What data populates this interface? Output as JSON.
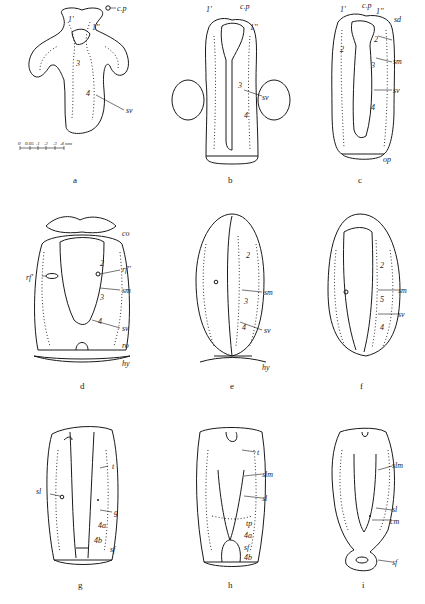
{
  "figure": {
    "panels": [
      {
        "id": "a",
        "caption": "a",
        "labels": [
          "c.p",
          "1'",
          "1''",
          "3",
          "4",
          "sv"
        ],
        "scale_bar": {
          "ticks": [
            "0",
            "0.05",
            ".1",
            ".2",
            ".3",
            ".4 mm"
          ]
        }
      },
      {
        "id": "b",
        "caption": "b",
        "labels": [
          "1'",
          "c.p",
          "1''",
          "3",
          "4",
          "sv"
        ]
      },
      {
        "id": "c",
        "caption": "c",
        "labels": [
          "1'",
          "c.p",
          "1''",
          "sd",
          "2",
          "2",
          "sm",
          "3",
          "sv",
          "4",
          "op"
        ]
      },
      {
        "id": "d",
        "caption": "d",
        "labels": [
          "co",
          "rf'",
          "rf''",
          "2",
          "sm",
          "3",
          "sv",
          "4",
          "ro",
          "hy"
        ]
      },
      {
        "id": "e",
        "caption": "e",
        "labels": [
          "2",
          "sm",
          "3",
          "sv",
          "4",
          "hy"
        ]
      },
      {
        "id": "f",
        "caption": "f",
        "labels": [
          "2",
          "sm",
          "5",
          "sv",
          "4"
        ]
      },
      {
        "id": "g",
        "caption": "g",
        "labels": [
          "t",
          "sl",
          "g",
          "4a",
          "4b",
          "sf"
        ]
      },
      {
        "id": "h",
        "caption": "h",
        "labels": [
          "t",
          "slm",
          "sl",
          "tp",
          "4a",
          "sf",
          "4b"
        ]
      },
      {
        "id": "i",
        "caption": "i",
        "labels": [
          "slm",
          "sl",
          "cm",
          "sf"
        ]
      }
    ]
  },
  "text": {
    "a": {
      "cp": "c.p",
      "one_p": "1'",
      "one_pp": "1''",
      "three": "3",
      "four": "4",
      "sv": "sv",
      "cap": "a",
      "s0": "0",
      "s1": "0.05",
      "s2": ".1",
      "s3": ".2",
      "s4": ".3",
      "s5": ".4 mm"
    },
    "b": {
      "one_p": "1'",
      "cp": "c.p",
      "one_pp": "1''",
      "three": "3",
      "four": "4",
      "sv": "sv",
      "cap": "b"
    },
    "c": {
      "one_p": "1'",
      "cp": "c.p",
      "one_pp": "1''",
      "sd": "sd",
      "two_l": "2",
      "two_r": "2",
      "sm": "sm",
      "three": "3",
      "sv": "sv",
      "four": "4",
      "op": "op",
      "cap": "c"
    },
    "d": {
      "co": "co",
      "rf1": "rf'",
      "rf2": "rf''",
      "two": "2",
      "sm": "sm",
      "three": "3",
      "sv": "sv",
      "four": "4",
      "ro": "ro",
      "hy": "hy",
      "cap": "d"
    },
    "e": {
      "two": "2",
      "sm": "sm",
      "three": "3",
      "sv": "sv",
      "four": "4",
      "hy": "hy",
      "cap": "e"
    },
    "f": {
      "two": "2",
      "sm": "sm",
      "five": "5",
      "sv": "sv",
      "four": "4",
      "cap": "f"
    },
    "g": {
      "t": "t",
      "sl": "sl",
      "g": "g",
      "fa": "4a",
      "fb": "4b",
      "sf": "sf",
      "cap": "g"
    },
    "h": {
      "t": "t",
      "slm": "slm",
      "sl": "sl",
      "tp": "tp",
      "fa": "4a",
      "sf": "sf",
      "fb": "4b",
      "cap": "h"
    },
    "i": {
      "slm": "slm",
      "sl": "sl",
      "cm": "cm",
      "sf": "sf",
      "cap": "i"
    }
  }
}
